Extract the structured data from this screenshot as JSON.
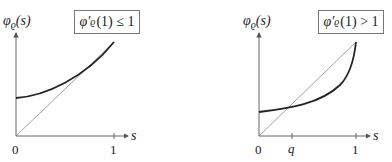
{
  "panels": [
    {
      "y_label": "φ",
      "y_label_sub": "ϱ",
      "y_label_arg": "(s)",
      "condition_func": "φ′",
      "condition_sub": "ϱ",
      "condition_rest": "(1) ≤ 1",
      "x_label": "s",
      "ticks": {
        "zero": "0",
        "one": "1"
      }
    },
    {
      "y_label": "φ",
      "y_label_sub": "ϱ",
      "y_label_arg": "(s)",
      "condition_func": "φ′",
      "condition_sub": "ϱ",
      "condition_rest": "(1) > 1",
      "x_label": "s",
      "ticks": {
        "zero": "0",
        "q": "q",
        "one": "1"
      }
    }
  ],
  "colors": {
    "curve": "#222222",
    "diagonal": "#777777",
    "axis": "#555555",
    "box_border": "#777777"
  }
}
